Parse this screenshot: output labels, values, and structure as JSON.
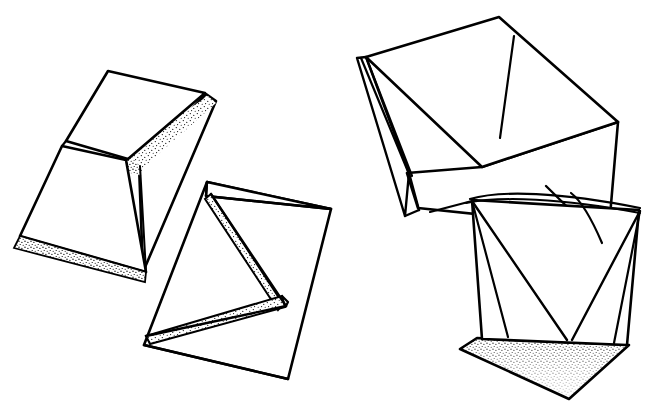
{
  "figure": {
    "caption": "",
    "background_color": "#ffffff",
    "ink_color": "#000000",
    "stipple_color": "#000000",
    "canvas": {
      "width": 659,
      "height": 418
    },
    "style": {
      "outline_stroke_width": 2.6,
      "crease_stroke_width": 2.0,
      "thin_stroke_width": 1.5
    }
  },
  "shapes": [
    {
      "id": "shape-1",
      "name": "folded-sheet-upper-left",
      "label": "Folded sheet, upper left",
      "faces": [
        {
          "name": "back-flap-upper",
          "shaded": true,
          "points": "120,148 206,94 216,102 139,165"
        },
        {
          "name": "front-panel-upper",
          "shaded": false,
          "points": "66,140 108,71 204,93 127,158"
        },
        {
          "name": "shadow-strip-lower",
          "shaded": true,
          "points": "14,247 138,282 141,268 17,234"
        },
        {
          "name": "front-panel-lower",
          "shaded": false,
          "points": "62,145 126,159 143,272 20,235"
        },
        {
          "name": "back-tab",
          "shaded": false,
          "points": "206,94 216,101 143,272 139,165"
        }
      ]
    },
    {
      "id": "shape-2",
      "name": "zigzag-accordion-lower-left",
      "label": "Accordion pleated sheet, lower centre-left",
      "faces": [
        {
          "name": "outer-panel",
          "shaded": false,
          "points": "207,182 330,208 288,378 144,344"
        },
        {
          "name": "pleat-shadow-upper",
          "shaded": true,
          "points": "205,199 275,308 281,303 210,195"
        },
        {
          "name": "pleat-shadow-lower",
          "shaded": true,
          "points": "148,334 281,296 283,306 152,342"
        }
      ]
    },
    {
      "id": "shape-3",
      "name": "open-box-upper-right",
      "label": "Open box form, upper right",
      "faces": [
        {
          "name": "box-top",
          "shaded": false,
          "points": "366,57 499,17 618,122 482,167"
        },
        {
          "name": "box-front",
          "shaded": false,
          "points": "407,173 482,167 618,122 609,228 418,208"
        },
        {
          "name": "box-left-fold",
          "shaded": false,
          "points": "358,58 366,57 408,172 404,215"
        },
        {
          "name": "right-flap",
          "shaded": true,
          "points": "514,36 590,115 546,185 500,138"
        }
      ]
    },
    {
      "id": "shape-4",
      "name": "cup-lower-right",
      "label": "Collapsed cup form, lower right",
      "faces": [
        {
          "name": "cup-body",
          "shaded": false,
          "points": "472,200 639,210 627,345 482,339"
        },
        {
          "name": "cup-bottom",
          "shaded": true,
          "points": "477,337 629,344 569,398 460,348"
        }
      ]
    }
  ],
  "annotations": []
}
